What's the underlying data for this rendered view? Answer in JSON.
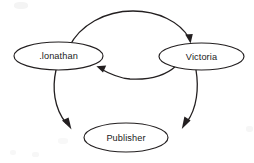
{
  "diagram": {
    "background_color": "#ffffff",
    "stroke_color": "#231f20",
    "nodes": [
      {
        "id": "jonathan",
        "label": ".lonathan",
        "shape": "ellipse",
        "cx": 58.5,
        "cy": 56,
        "rx": 44.5,
        "ry": 14
      },
      {
        "id": "victoria",
        "label": "Victoria",
        "shape": "ellipse",
        "cx": 201.5,
        "cy": 56.5,
        "rx": 42.5,
        "ry": 13.5
      },
      {
        "id": "publisher",
        "label": "Publisher",
        "shape": "ellipse",
        "cx": 126,
        "cy": 137.5,
        "rx": 42,
        "ry": 14.5
      }
    ],
    "edges": [
      {
        "id": "jonathan-to-victoria",
        "from": "jonathan",
        "to": "victoria",
        "label": "",
        "style": "curved-arc-above",
        "direction": "right"
      },
      {
        "id": "victoria-to-jonathan",
        "from": "victoria",
        "to": "jonathan",
        "label": "",
        "style": "curved-arc-below",
        "direction": "left"
      },
      {
        "id": "jonathan-to-publisher",
        "from": "jonathan",
        "to": "publisher",
        "label": "",
        "style": "curved-arc-left",
        "direction": "down"
      },
      {
        "id": "victoria-to-publisher",
        "from": "victoria",
        "to": "publisher",
        "label": "",
        "style": "curved-arc-right",
        "direction": "down"
      }
    ]
  }
}
